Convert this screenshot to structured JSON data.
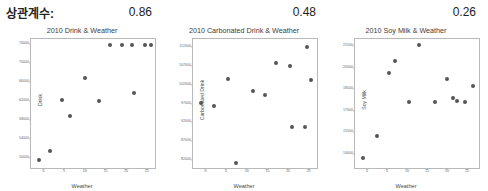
{
  "header": {
    "corr_label": "상관계수:",
    "values": [
      "0.86",
      "0.48",
      "0.26"
    ]
  },
  "charts": [
    {
      "title": "2010 Drink & Weather",
      "xlabel": "Weather",
      "ylabel": "Drink",
      "correlation": "0.86",
      "chart_data": {
        "type": "scatter",
        "title": "2010 Drink & Weather",
        "xlabel": "Weather",
        "ylabel": "Drink",
        "xlim": [
          -3,
          27
        ],
        "ylim": [
          48000,
          75000
        ],
        "xticks": [
          "0",
          "5",
          "10",
          "15",
          "20",
          "25"
        ],
        "xtick_values": [
          0,
          5,
          10,
          15,
          20,
          25
        ],
        "yticks": [
          "50000",
          "54000",
          "58000",
          "62000",
          "66000",
          "70000",
          "74000"
        ],
        "ytick_values": [
          50000,
          54000,
          58000,
          62000,
          66000,
          70000,
          74000
        ],
        "grid": false,
        "legend": "none",
        "x": [
          -1.0,
          1.5,
          4.5,
          6.5,
          10.0,
          13.5,
          16.0,
          19.0,
          21.5,
          24.5,
          26.0,
          22.0
        ],
        "y": [
          49600,
          51600,
          62200,
          58800,
          66800,
          62000,
          73800,
          73800,
          73800,
          73800,
          73800,
          63600
        ],
        "points": [
          {
            "x": -1.0,
            "y": 49600
          },
          {
            "x": 1.5,
            "y": 51600
          },
          {
            "x": 4.5,
            "y": 62200
          },
          {
            "x": 6.5,
            "y": 58800
          },
          {
            "x": 10.0,
            "y": 66800
          },
          {
            "x": 13.5,
            "y": 62000
          },
          {
            "x": 16.0,
            "y": 73800
          },
          {
            "x": 19.0,
            "y": 73800
          },
          {
            "x": 21.5,
            "y": 73800
          },
          {
            "x": 24.5,
            "y": 73800
          },
          {
            "x": 26.0,
            "y": 73800
          },
          {
            "x": 22.0,
            "y": 63600
          }
        ]
      }
    },
    {
      "title": "2010 Carbonated Drink & Weather",
      "xlabel": "Weather",
      "ylabel": "Carbonated Drink",
      "correlation": "0.48",
      "chart_data": {
        "type": "scatter",
        "title": "2010 Carbonated Drink & Weather",
        "xlabel": "Weather",
        "ylabel": "Carbonated Drink",
        "xlim": [
          -3,
          27
        ],
        "ylim": [
          80000,
          114000
        ],
        "xticks": [
          "0",
          "5",
          "10",
          "15",
          "20",
          "25"
        ],
        "xtick_values": [
          0,
          5,
          10,
          15,
          20,
          25
        ],
        "yticks": [
          "82000",
          "87000",
          "92000",
          "97000",
          "102000",
          "107000",
          "112000"
        ],
        "ytick_values": [
          82000,
          87000,
          92000,
          97000,
          102000,
          107000,
          112000
        ],
        "grid": false,
        "legend": "none",
        "x": [
          -1.0,
          2.0,
          5.5,
          7.5,
          11.5,
          14.5,
          17.0,
          20.5,
          21.0,
          24.5,
          25.5,
          24.0
        ],
        "y": [
          97200,
          96300,
          103400,
          81200,
          100200,
          99300,
          107800,
          107000,
          90700,
          111800,
          103100,
          90700
        ],
        "points": [
          {
            "x": -1.0,
            "y": 97200
          },
          {
            "x": 2.0,
            "y": 96300
          },
          {
            "x": 5.5,
            "y": 103400
          },
          {
            "x": 7.5,
            "y": 81200
          },
          {
            "x": 11.5,
            "y": 100200
          },
          {
            "x": 14.5,
            "y": 99300
          },
          {
            "x": 17.0,
            "y": 107800
          },
          {
            "x": 20.5,
            "y": 107000
          },
          {
            "x": 21.0,
            "y": 90700
          },
          {
            "x": 24.5,
            "y": 111800
          },
          {
            "x": 25.5,
            "y": 103100
          },
          {
            "x": 24.0,
            "y": 90700
          }
        ]
      }
    },
    {
      "title": "2010 Soy Milk & Weather",
      "xlabel": "Weather",
      "ylabel": "Soy Milk",
      "correlation": "0.26",
      "chart_data": {
        "type": "scatter",
        "title": "2010 Soy Milk & Weather",
        "xlabel": "Weather",
        "ylabel": "Soy Milk",
        "xlim": [
          -3,
          28
        ],
        "ylim": [
          13000,
          22000
        ],
        "xticks": [
          "0",
          "5",
          "10",
          "15",
          "20",
          "25"
        ],
        "xtick_values": [
          0,
          5,
          10,
          15,
          20,
          25
        ],
        "yticks": [
          "14000",
          "15500",
          "17000",
          "18500",
          "20000",
          "21500"
        ],
        "ytick_values": [
          14000,
          15500,
          17000,
          18500,
          20000,
          21500
        ],
        "grid": false,
        "legend": "none",
        "x": [
          -1.0,
          2.5,
          5.5,
          7.0,
          13.0,
          10.5,
          17.0,
          21.5,
          22.5,
          24.5,
          26.5,
          20.0
        ],
        "y": [
          13700,
          15200,
          19600,
          20500,
          21600,
          17600,
          17600,
          17900,
          17700,
          17600,
          18700,
          19200
        ],
        "points": [
          {
            "x": -1.0,
            "y": 13700
          },
          {
            "x": 2.5,
            "y": 15200
          },
          {
            "x": 5.5,
            "y": 19600
          },
          {
            "x": 7.0,
            "y": 20500
          },
          {
            "x": 13.0,
            "y": 21600
          },
          {
            "x": 10.5,
            "y": 17600
          },
          {
            "x": 17.0,
            "y": 17600
          },
          {
            "x": 21.5,
            "y": 17900
          },
          {
            "x": 22.5,
            "y": 17700
          },
          {
            "x": 24.5,
            "y": 17600
          },
          {
            "x": 26.5,
            "y": 18700
          },
          {
            "x": 20.0,
            "y": 19200
          }
        ]
      }
    }
  ]
}
